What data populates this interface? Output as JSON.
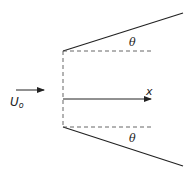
{
  "diagram": {
    "labels": {
      "theta_top": "θ",
      "theta_bottom": "θ",
      "x_axis": "x",
      "velocity_main": "U",
      "velocity_sub": "o"
    },
    "colors": {
      "line": "#222222",
      "dashed": "#555555",
      "background": "#ffffff"
    }
  }
}
